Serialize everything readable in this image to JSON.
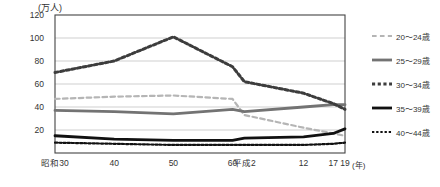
{
  "chart_data": {
    "type": "line",
    "title": "",
    "subtitle": "",
    "xlabel": "(年)",
    "ylabel": "(万人)",
    "y_unit": "(万人)",
    "x_unit": "(年)",
    "grid": true,
    "legend_position": "right",
    "ylim": [
      0,
      120
    ],
    "yticks": [
      20,
      40,
      60,
      80,
      100,
      120
    ],
    "ytick_labels": [
      "20",
      "40",
      "60",
      "80",
      "100",
      "120"
    ],
    "x": [
      30,
      40,
      50,
      60,
      62,
      72,
      77,
      79
    ],
    "categories": [
      "昭和30",
      "40",
      "50",
      "60",
      "平成2",
      "12",
      "17",
      "19"
    ],
    "xtick_labels": [
      "昭和30",
      "40",
      "50",
      "60",
      "平成2",
      "12",
      "17",
      "19"
    ],
    "series": [
      {
        "name": "20～24歳",
        "style": "dashed",
        "color": "#b5b5b5",
        "width": 2.2,
        "values": [
          47,
          49,
          50,
          47,
          33,
          22,
          17,
          15
        ]
      },
      {
        "name": "25～29歳",
        "style": "solid",
        "color": "#737373",
        "width": 2.8,
        "values": [
          37,
          36,
          34,
          38,
          36,
          40,
          42,
          42
        ]
      },
      {
        "name": "30～34歳",
        "style": "dotted",
        "color": "#3d3d3d",
        "width": 3.0,
        "values": [
          70,
          80,
          101,
          75,
          62,
          52,
          43,
          38
        ]
      },
      {
        "name": "35～39歳",
        "style": "solid",
        "color": "#111111",
        "width": 2.8,
        "values": [
          15,
          12,
          11,
          11,
          13,
          14,
          17,
          21
        ]
      },
      {
        "name": "40～44歳",
        "style": "dotted",
        "color": "#111111",
        "width": 2.2,
        "values": [
          9,
          8,
          7,
          7,
          7,
          7,
          8,
          9
        ]
      }
    ]
  },
  "legend": {
    "items": [
      {
        "label": "20～24歳"
      },
      {
        "label": "25～29歳"
      },
      {
        "label": "30～34歳"
      },
      {
        "label": "35～39歳"
      },
      {
        "label": "40～44歳"
      }
    ]
  }
}
